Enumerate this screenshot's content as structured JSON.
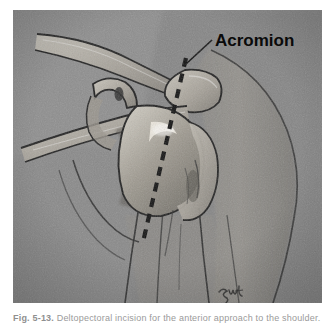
{
  "page": {
    "background_color": "#ffffff",
    "width": 334,
    "height": 326
  },
  "figure": {
    "plate_background_color": "#8b8b8b",
    "ink_color": "#1a1a1a",
    "bone_light_color": "#d8d5cd",
    "bone_mid_color": "#a9a49a",
    "shadow_color": "#5c5c5c",
    "labels": [
      {
        "id": "acromion",
        "text": "Acromion",
        "leader": "leader-line-acromion"
      }
    ],
    "annotations": {
      "incision_line": {
        "name": "dashed-incision-line",
        "style": "dashed",
        "color": "#101010"
      }
    },
    "signature": {
      "name": "artist-signature",
      "text": "smc"
    },
    "anatomy": [
      {
        "id": "clavicle",
        "label": "Clavicle"
      },
      {
        "id": "acromion-process",
        "label": "Acromion process"
      },
      {
        "id": "coracoid-process",
        "label": "Coracoid process"
      },
      {
        "id": "scapular-spine",
        "label": "Scapular spine"
      },
      {
        "id": "humeral-head",
        "label": "Humeral head"
      },
      {
        "id": "greater-tuberosity",
        "label": "Greater tuberosity"
      },
      {
        "id": "humeral-shaft",
        "label": "Humeral shaft"
      },
      {
        "id": "deltoid-contour",
        "label": "Deltoid contour"
      }
    ]
  },
  "caption": {
    "label": "Fig. 5-13.",
    "text": "Deltopectoral incision for the anterior approach to the shoulder."
  }
}
